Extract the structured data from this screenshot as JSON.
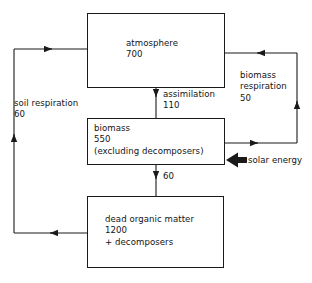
{
  "diagram": {
    "stroke_color": "#1a1a1a",
    "text_color": "#141414",
    "background": "#ffffff",
    "boxes": [
      {
        "id": "atmosphere",
        "name": "atmosphere",
        "amount": "700",
        "text": "atmosphere\n700"
      },
      {
        "id": "biomass",
        "name": "biomass",
        "amount": "550",
        "note": "(excluding decomposers)",
        "text": "biomass\n550\n(excluding decomposers)"
      },
      {
        "id": "dead-organic-matter",
        "name": "dead organic matter",
        "amount": "1200",
        "note": "+ decomposers",
        "text": "dead organic matter\n1200\n+ decomposers"
      }
    ],
    "flows": [
      {
        "id": "soil-respiration",
        "label": "soil respiration",
        "value": "60",
        "text": "soil respiration\n60",
        "from": "dead organic matter",
        "to": "atmosphere"
      },
      {
        "id": "assimilation",
        "label": "assimilation",
        "value": "110",
        "text": "assimilation\n110",
        "from": "atmosphere",
        "to": "biomass"
      },
      {
        "id": "biomass-respiration",
        "label": "biomass respiration",
        "value": "50",
        "text": "biomass\nrespiration\n50",
        "from": "biomass",
        "to": "atmosphere"
      },
      {
        "id": "litterfall",
        "label": "",
        "value": "60",
        "text": "60",
        "from": "biomass",
        "to": "dead organic matter"
      },
      {
        "id": "solar-energy",
        "label": "solar energy",
        "value": "",
        "text": "solar energy",
        "from": "sun",
        "to": "biomass"
      }
    ]
  }
}
